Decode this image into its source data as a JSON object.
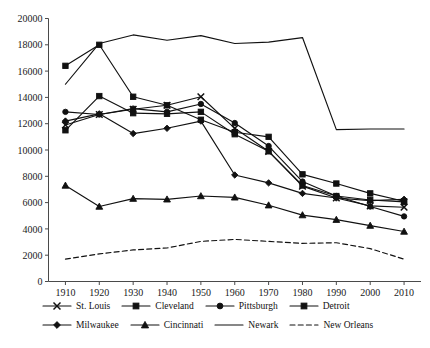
{
  "chart_data": {
    "type": "line",
    "title": "",
    "subtitle": "",
    "xlabel": "",
    "ylabel": "",
    "x": [
      1910,
      1920,
      1930,
      1940,
      1950,
      1960,
      1970,
      1980,
      1990,
      2000,
      2010
    ],
    "xlim": [
      1905,
      2015
    ],
    "ylim": [
      0,
      20000
    ],
    "grid": false,
    "legend_position": "bottom",
    "y_ticks": [
      0,
      2000,
      4000,
      6000,
      8000,
      10000,
      12000,
      14000,
      16000,
      18000,
      20000
    ],
    "y_tick_labels": [
      "0",
      "2000",
      "4000",
      "6000",
      "8000",
      "10000",
      "12000",
      "14000",
      "16000",
      "18000",
      "20000"
    ],
    "x_tick_labels": [
      "1910",
      "1920",
      "1930",
      "1940",
      "1950",
      "1960",
      "1970",
      "1980",
      "1990",
      "2000",
      "2010"
    ],
    "series": [
      {
        "name": "St. Louis",
        "marker": "x",
        "line": "solid",
        "values": [
          11900,
          12700,
          13100,
          13400,
          14050,
          11650,
          9900,
          7250,
          6350,
          5750,
          5650
        ]
      },
      {
        "name": "Cleveland",
        "marker": "square",
        "line": "solid",
        "values": [
          11500,
          14100,
          12800,
          12750,
          12900,
          11200,
          9900,
          7300,
          6500,
          6200,
          6050
        ]
      },
      {
        "name": "Pittsburgh",
        "marker": "circle",
        "line": "solid",
        "values": [
          12900,
          12700,
          13150,
          12900,
          13500,
          12050,
          10300,
          7600,
          6500,
          5700,
          4950
        ]
      },
      {
        "name": "Detroit",
        "marker": "square",
        "line": "solid",
        "values": [
          16400,
          18000,
          14050,
          13400,
          12300,
          11350,
          11000,
          8150,
          7450,
          6700,
          6100
        ]
      },
      {
        "name": "Milwaukee",
        "marker": "diamond",
        "line": "solid",
        "values": [
          12200,
          12750,
          11250,
          11650,
          12200,
          8100,
          7500,
          6700,
          6350,
          6150,
          6250
        ]
      },
      {
        "name": "Cincinnati",
        "marker": "triangle",
        "line": "solid",
        "values": [
          7300,
          5700,
          6300,
          6250,
          6500,
          6400,
          5800,
          5050,
          4700,
          4250,
          3800
        ]
      },
      {
        "name": "Newark",
        "marker": "none",
        "line": "solid",
        "values": [
          15000,
          18100,
          18750,
          18350,
          18700,
          18100,
          18200,
          18550,
          11550,
          11600,
          11600
        ]
      },
      {
        "name": "New Orleans",
        "marker": "none",
        "line": "dashed",
        "values": [
          1700,
          2100,
          2400,
          2550,
          3050,
          3200,
          3050,
          2900,
          2950,
          2500,
          1700
        ]
      }
    ]
  },
  "legend": {
    "rows": [
      [
        {
          "label": "St. Louis",
          "marker": "x",
          "line": "solid"
        },
        {
          "label": "Cleveland",
          "marker": "square",
          "line": "solid"
        },
        {
          "label": "Pittsburgh",
          "marker": "circle",
          "line": "solid"
        },
        {
          "label": "Detroit",
          "marker": "square",
          "line": "solid"
        }
      ],
      [
        {
          "label": "Milwaukee",
          "marker": "diamond",
          "line": "solid"
        },
        {
          "label": "Cincinnati",
          "marker": "triangle",
          "line": "solid"
        },
        {
          "label": "Newark",
          "marker": "none",
          "line": "solid"
        },
        {
          "label": "New Orleans",
          "marker": "none",
          "line": "dashed"
        }
      ]
    ]
  },
  "caption": {
    "text": ""
  }
}
